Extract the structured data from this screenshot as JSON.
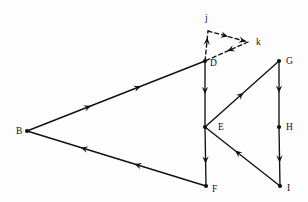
{
  "diagram": {
    "canvas": {
      "width": 308,
      "height": 202,
      "background": "#fdfdfd"
    },
    "ink_color": "#111111",
    "nodes": [
      {
        "id": "B",
        "label": "B",
        "x": 27,
        "y": 131,
        "label_x": 16,
        "label_y": 134,
        "dot": true,
        "style": "solid"
      },
      {
        "id": "D",
        "label": "D",
        "x": 205,
        "y": 61,
        "label_x": 210,
        "label_y": 66,
        "dot": true,
        "style": "solid"
      },
      {
        "id": "E",
        "label": "E",
        "x": 205,
        "y": 127,
        "label_x": 218,
        "label_y": 130,
        "dot": true,
        "style": "solid"
      },
      {
        "id": "F",
        "label": "F",
        "x": 206,
        "y": 186,
        "label_x": 212,
        "label_y": 192,
        "dot": true,
        "style": "solid"
      },
      {
        "id": "G",
        "label": "G",
        "x": 279,
        "y": 61,
        "label_x": 286,
        "label_y": 64,
        "dot": true,
        "style": "solid"
      },
      {
        "id": "H",
        "label": "H",
        "x": 279,
        "y": 127,
        "label_x": 286,
        "label_y": 130,
        "dot": true,
        "style": "solid"
      },
      {
        "id": "I",
        "label": "I",
        "x": 280,
        "y": 186,
        "label_x": 287,
        "label_y": 191,
        "dot": true,
        "style": "solid"
      },
      {
        "id": "j",
        "label": "j",
        "x": 208,
        "y": 31,
        "label_x": 205,
        "label_y": 21,
        "dot": false,
        "style": "dashed"
      },
      {
        "id": "k",
        "label": "k",
        "x": 248,
        "y": 42,
        "label_x": 256,
        "label_y": 45,
        "dot": false,
        "style": "dashed"
      }
    ],
    "edges": [
      {
        "id": "B-D",
        "from": "B",
        "to": "D",
        "style": "solid",
        "direction": "forward",
        "arrow_count": 2,
        "arrow_positions": [
          0.36,
          0.64
        ]
      },
      {
        "id": "F-B",
        "from": "F",
        "to": "B",
        "style": "solid",
        "direction": "forward",
        "arrow_count": 2,
        "arrow_positions": [
          0.4,
          0.7
        ]
      },
      {
        "id": "D-E",
        "from": "D",
        "to": "E",
        "style": "solid",
        "direction": "forward",
        "arrow_count": 1,
        "arrow_positions": [
          0.5
        ]
      },
      {
        "id": "E-F",
        "from": "E",
        "to": "F",
        "style": "solid",
        "direction": "forward",
        "arrow_count": 1,
        "arrow_positions": [
          0.62
        ]
      },
      {
        "id": "E-G",
        "from": "E",
        "to": "G",
        "style": "solid",
        "direction": "forward",
        "arrow_count": 1,
        "arrow_positions": [
          0.52
        ]
      },
      {
        "id": "G-H",
        "from": "G",
        "to": "H",
        "style": "solid",
        "direction": "forward",
        "arrow_count": 1,
        "arrow_positions": [
          0.48
        ]
      },
      {
        "id": "H-I",
        "from": "H",
        "to": "I",
        "style": "solid",
        "direction": "forward",
        "arrow_count": 1,
        "arrow_positions": [
          0.6
        ]
      },
      {
        "id": "I-E",
        "from": "I",
        "to": "E",
        "style": "solid",
        "direction": "forward",
        "arrow_count": 1,
        "arrow_positions": [
          0.6
        ]
      },
      {
        "id": "D-j",
        "from": "D",
        "to": "j",
        "style": "dashed",
        "direction": "forward",
        "arrow_count": 1,
        "arrow_positions": [
          0.78
        ]
      },
      {
        "id": "j-k",
        "from": "j",
        "to": "k",
        "style": "dashed",
        "direction": "forward",
        "arrow_count": 2,
        "arrow_positions": [
          0.5,
          0.95
        ]
      },
      {
        "id": "k-D",
        "from": "k",
        "to": "D",
        "style": "dashed",
        "direction": "forward",
        "arrow_count": 1,
        "arrow_positions": [
          0.48
        ]
      }
    ]
  }
}
